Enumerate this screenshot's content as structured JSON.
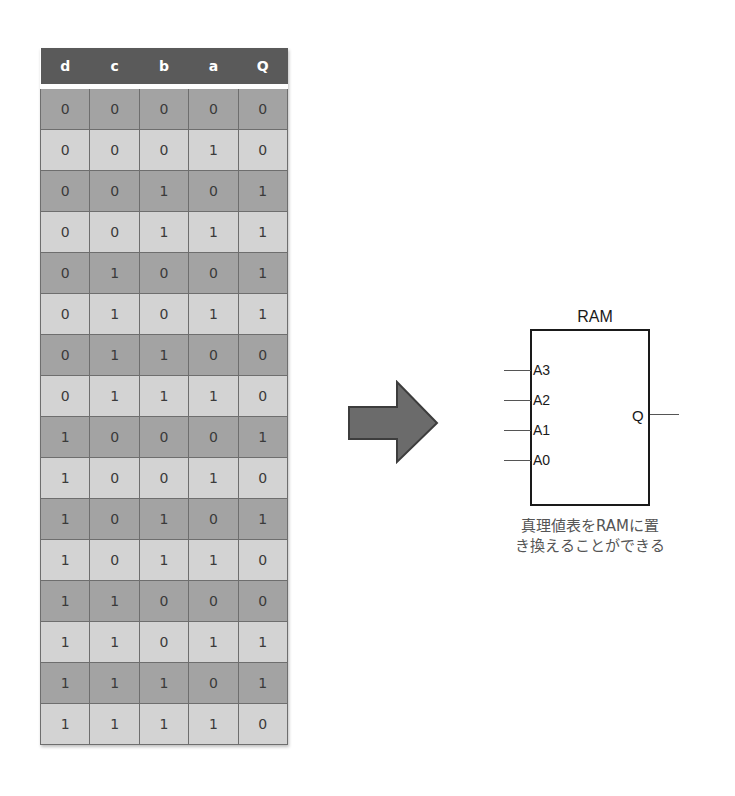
{
  "table": {
    "headers": [
      "d",
      "c",
      "b",
      "a",
      "Q"
    ],
    "rows": [
      [
        "0",
        "0",
        "0",
        "0",
        "0"
      ],
      [
        "0",
        "0",
        "0",
        "1",
        "0"
      ],
      [
        "0",
        "0",
        "1",
        "0",
        "1"
      ],
      [
        "0",
        "0",
        "1",
        "1",
        "1"
      ],
      [
        "0",
        "1",
        "0",
        "0",
        "1"
      ],
      [
        "0",
        "1",
        "0",
        "1",
        "1"
      ],
      [
        "0",
        "1",
        "1",
        "0",
        "0"
      ],
      [
        "0",
        "1",
        "1",
        "1",
        "0"
      ],
      [
        "1",
        "0",
        "0",
        "0",
        "1"
      ],
      [
        "1",
        "0",
        "0",
        "1",
        "0"
      ],
      [
        "1",
        "0",
        "1",
        "0",
        "1"
      ],
      [
        "1",
        "0",
        "1",
        "1",
        "0"
      ],
      [
        "1",
        "1",
        "0",
        "0",
        "0"
      ],
      [
        "1",
        "1",
        "0",
        "1",
        "1"
      ],
      [
        "1",
        "1",
        "1",
        "0",
        "1"
      ],
      [
        "1",
        "1",
        "1",
        "1",
        "0"
      ]
    ]
  },
  "ram": {
    "title": "RAM",
    "inputs": [
      "A3",
      "A2",
      "A1",
      "A0"
    ],
    "output": "Q"
  },
  "caption": {
    "line1": "真理値表をRAMに置",
    "line2": "き換えることができる"
  },
  "colors": {
    "header_bg": "#5a5a5a",
    "row_dark": "#a3a3a3",
    "row_light": "#d3d3d3",
    "arrow_fill": "#6b6b6b"
  }
}
